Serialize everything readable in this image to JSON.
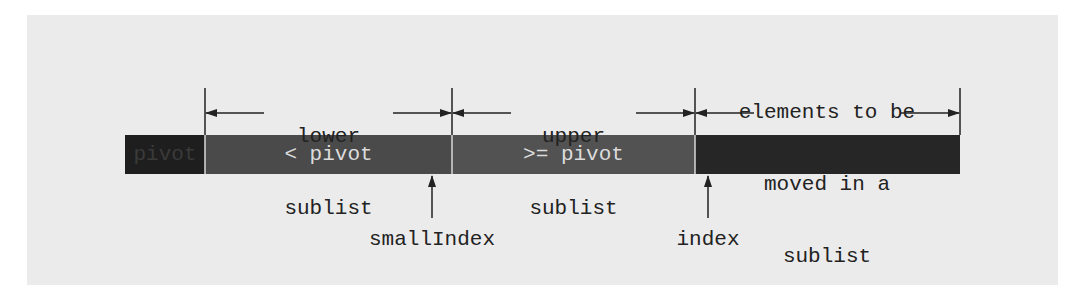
{
  "diagram": {
    "colors": {
      "panel_bg": "#ebebeb",
      "pivot_cell": "#1e1e1e",
      "lower_cell": "#4a4a4a",
      "upper_cell": "#525252",
      "unprocessed_cell": "#262626",
      "cell_text": "#dcdcdc",
      "line": "#222222"
    },
    "cells": [
      {
        "id": "pivot",
        "label": "pivot"
      },
      {
        "id": "lower",
        "label": "< pivot"
      },
      {
        "id": "upper",
        "label": ">= pivot"
      },
      {
        "id": "unprocessed",
        "label": ""
      }
    ],
    "brackets": [
      {
        "id": "lower-sublist",
        "lines": [
          "lower",
          "sublist"
        ]
      },
      {
        "id": "upper-sublist",
        "lines": [
          "upper",
          "sublist"
        ]
      },
      {
        "id": "to-move",
        "lines": [
          "elements to be",
          "moved in a",
          "sublist"
        ]
      }
    ],
    "pointers": [
      {
        "id": "smallIndex",
        "label": "smallIndex"
      },
      {
        "id": "index",
        "label": "index"
      }
    ]
  }
}
